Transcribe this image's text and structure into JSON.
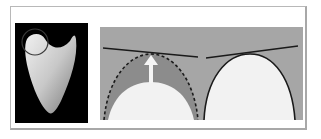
{
  "figure": {
    "photo": {
      "subject": "tooth-cusp-photograph",
      "background": "#000000",
      "marker": "circle-around-cusp-tip"
    },
    "diagram": {
      "panel_bg": "#a6a6a6",
      "left_panel": {
        "shape": "cusp-arch",
        "outline_style": "dashed",
        "shaded_region": "#8c8c8c",
        "arrow": "up-arrow",
        "tangent_line": "line"
      },
      "right_panel": {
        "shape": "cusp-arch",
        "outline_style": "solid",
        "tangent_line": "line"
      },
      "colors": {
        "line": "#1a1a1a",
        "arch_fill": "#f2f2f2",
        "arrow": "#f5f5f5"
      }
    }
  }
}
